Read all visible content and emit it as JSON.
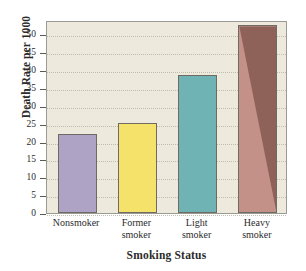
{
  "chart_data": {
    "type": "bar",
    "title": "",
    "xlabel": "Smoking Status",
    "ylabel": "Death Rate per 1000",
    "categories": [
      "Nonsmoker",
      "Former smoker",
      "Light smoker",
      "Heavy smoker"
    ],
    "category_lines": [
      [
        "Nonsmoker",
        ""
      ],
      [
        "Former",
        "smoker"
      ],
      [
        "Light",
        "smoker"
      ],
      [
        "Heavy",
        "smoker"
      ]
    ],
    "values": [
      22.0,
      25.3,
      38.7,
      52.5
    ],
    "ylim": [
      0,
      54
    ],
    "yticks": [
      0,
      5,
      10,
      15,
      20,
      25,
      30,
      35,
      40,
      45,
      50
    ],
    "ytick_labels": [
      "0",
      "5",
      "10",
      "15",
      "20",
      "25",
      "30",
      "35",
      "40",
      "45",
      "50"
    ],
    "grid": true,
    "legend": "none",
    "bar_colors": [
      "#aea3c4",
      "#f5e26b",
      "#6fb3b5",
      "#c49189"
    ],
    "bar_accent_colors": [
      "#aea3c4",
      "#f5e26b",
      "#6fb3b5",
      "#8e6258"
    ],
    "bar_edge_color": "#6f6b63",
    "plot_background": "#edeadd",
    "grid_color": "#b9b6a5",
    "axis_color": "#9b9b96",
    "text_color": "#2b2b2b"
  }
}
